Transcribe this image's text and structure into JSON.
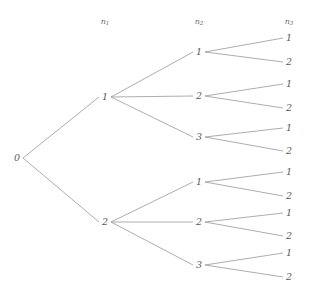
{
  "diagram": {
    "type": "tree",
    "title": "",
    "colors": {
      "background": "#ffffff",
      "edge": "#8a8a8a",
      "label": "#5a5a5a",
      "header": "#6a6a6a"
    },
    "headers": [
      {
        "id": "h1",
        "base": "n",
        "sub": "1",
        "x": 105,
        "y": 22
      },
      {
        "id": "h2",
        "base": "n",
        "sub": "2",
        "x": 199,
        "y": 22
      },
      {
        "id": "h3",
        "base": "n",
        "sub": "3",
        "x": 289,
        "y": 22
      }
    ],
    "nodes": [
      {
        "id": "root",
        "label": "0",
        "level": 0,
        "x": 17,
        "y": 158
      },
      {
        "id": "n1a",
        "label": "1",
        "level": 1,
        "x": 105,
        "y": 97
      },
      {
        "id": "n1b",
        "label": "2",
        "level": 1,
        "x": 105,
        "y": 222
      },
      {
        "id": "n2a1",
        "label": "1",
        "level": 2,
        "x": 199,
        "y": 52
      },
      {
        "id": "n2a2",
        "label": "2",
        "level": 2,
        "x": 199,
        "y": 96
      },
      {
        "id": "n2a3",
        "label": "3",
        "level": 2,
        "x": 199,
        "y": 137
      },
      {
        "id": "n2b1",
        "label": "1",
        "level": 2,
        "x": 199,
        "y": 182
      },
      {
        "id": "n2b2",
        "label": "2",
        "level": 2,
        "x": 199,
        "y": 222
      },
      {
        "id": "n2b3",
        "label": "3",
        "level": 2,
        "x": 199,
        "y": 265
      },
      {
        "id": "l1",
        "label": "1",
        "level": 3,
        "x": 289,
        "y": 38
      },
      {
        "id": "l2",
        "label": "2",
        "level": 3,
        "x": 289,
        "y": 62
      },
      {
        "id": "l3",
        "label": "1",
        "level": 3,
        "x": 289,
        "y": 84
      },
      {
        "id": "l4",
        "label": "2",
        "level": 3,
        "x": 289,
        "y": 108
      },
      {
        "id": "l5",
        "label": "1",
        "level": 3,
        "x": 289,
        "y": 128
      },
      {
        "id": "l6",
        "label": "2",
        "level": 3,
        "x": 289,
        "y": 151
      },
      {
        "id": "l7",
        "label": "1",
        "level": 3,
        "x": 289,
        "y": 172
      },
      {
        "id": "l8",
        "label": "2",
        "level": 3,
        "x": 289,
        "y": 196
      },
      {
        "id": "l9",
        "label": "1",
        "level": 3,
        "x": 289,
        "y": 213
      },
      {
        "id": "l10",
        "label": "2",
        "level": 3,
        "x": 289,
        "y": 236
      },
      {
        "id": "l11",
        "label": "1",
        "level": 3,
        "x": 289,
        "y": 253
      },
      {
        "id": "l12",
        "label": "2",
        "level": 3,
        "x": 289,
        "y": 277
      }
    ],
    "edges": [
      {
        "id": "e-root-1",
        "from": "root",
        "to": "n1a"
      },
      {
        "id": "e-root-2",
        "from": "root",
        "to": "n1b"
      },
      {
        "id": "e-1-1",
        "from": "n1a",
        "to": "n2a1"
      },
      {
        "id": "e-1-2",
        "from": "n1a",
        "to": "n2a2"
      },
      {
        "id": "e-1-3",
        "from": "n1a",
        "to": "n2a3"
      },
      {
        "id": "e-2-1",
        "from": "n1b",
        "to": "n2b1"
      },
      {
        "id": "e-2-2",
        "from": "n1b",
        "to": "n2b2"
      },
      {
        "id": "e-2-3",
        "from": "n1b",
        "to": "n2b3"
      },
      {
        "id": "e-2a1-l1",
        "from": "n2a1",
        "to": "l1"
      },
      {
        "id": "e-2a1-l2",
        "from": "n2a1",
        "to": "l2"
      },
      {
        "id": "e-2a2-l3",
        "from": "n2a2",
        "to": "l3"
      },
      {
        "id": "e-2a2-l4",
        "from": "n2a2",
        "to": "l4"
      },
      {
        "id": "e-2a3-l5",
        "from": "n2a3",
        "to": "l5"
      },
      {
        "id": "e-2a3-l6",
        "from": "n2a3",
        "to": "l6"
      },
      {
        "id": "e-2b1-l7",
        "from": "n2b1",
        "to": "l7"
      },
      {
        "id": "e-2b1-l8",
        "from": "n2b1",
        "to": "l8"
      },
      {
        "id": "e-2b2-l9",
        "from": "n2b2",
        "to": "l9"
      },
      {
        "id": "e-2b2-l10",
        "from": "n2b2",
        "to": "l10"
      },
      {
        "id": "e-2b3-l11",
        "from": "n2b3",
        "to": "l11"
      },
      {
        "id": "e-2b3-l12",
        "from": "n2b3",
        "to": "l12"
      }
    ],
    "geometry": {
      "node_gap_right": 6,
      "node_gap_left": 6
    }
  }
}
